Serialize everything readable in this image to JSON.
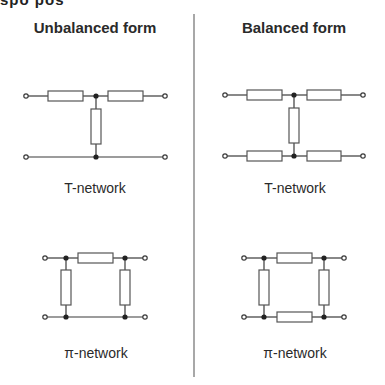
{
  "top_fragment": "spo pos",
  "columns": [
    {
      "heading": "Unbalanced form",
      "t_network": {
        "label": "T-network",
        "form": "unbalanced",
        "series_resistors": 2,
        "shunt_resistors": 1
      },
      "pi_network": {
        "label": "π-network",
        "form": "unbalanced",
        "series_resistors": 1,
        "shunt_resistors": 2
      }
    },
    {
      "heading": "Balanced form",
      "t_network": {
        "label": "T-network",
        "form": "balanced",
        "series_resistors": 4,
        "shunt_resistors": 1
      },
      "pi_network": {
        "label": "π-network",
        "form": "balanced",
        "series_resistors": 2,
        "shunt_resistors": 2
      }
    }
  ],
  "colors": {
    "wire": "#3a3a3a",
    "resistor_stroke": "#555555",
    "divider": "#a8a8a8",
    "text": "#2a2a2a"
  }
}
